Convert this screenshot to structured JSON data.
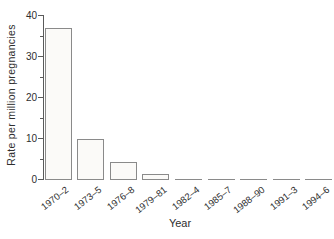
{
  "chart_data": {
    "type": "bar",
    "title": "",
    "xlabel": "Year",
    "ylabel": "Rate per million pregnancies",
    "categories": [
      "1970–2",
      "1973–5",
      "1976–8",
      "1979–81",
      "1982–4",
      "1985–7",
      "1988–90",
      "1991–3",
      "1994–6"
    ],
    "values": [
      37,
      10,
      4.3,
      1.5,
      0,
      0,
      0,
      0,
      0
    ],
    "ylim": [
      0,
      40
    ],
    "yticks_major": [
      0,
      10,
      20,
      30,
      40
    ],
    "yticks_minor": [
      5,
      15,
      25,
      35
    ],
    "grid": false,
    "legend": null,
    "colors": {
      "background": "#ffffff",
      "bar_fill": "#fbfaf8",
      "bar_border": "#8a8a8a",
      "axis": "#5a5a5a",
      "text": "#2e2e2e"
    }
  }
}
